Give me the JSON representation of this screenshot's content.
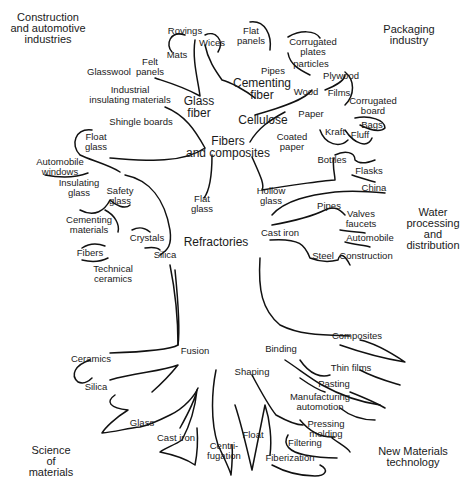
{
  "domains": [
    {
      "id": "construction",
      "label": "Construction\nand automotive\nindustries",
      "x": 48,
      "y": 28
    },
    {
      "id": "packaging",
      "label": "Packaging\nindustry",
      "x": 409,
      "y": 35
    },
    {
      "id": "water",
      "label": "Water\nprocessing\nand\ndistribution",
      "x": 433,
      "y": 229
    },
    {
      "id": "science",
      "label": "Science\nof\nmaterials",
      "x": 51,
      "y": 461
    },
    {
      "id": "new-materials",
      "label": "New Materials\ntechnology",
      "x": 413,
      "y": 457
    }
  ],
  "main_nodes": [
    {
      "id": "fibers-composites",
      "label": "Fibers\nand composites",
      "x": 228,
      "y": 147
    },
    {
      "id": "glass-fiber",
      "label": "Glass\nfiber",
      "x": 199,
      "y": 107
    },
    {
      "id": "cementing-fiber",
      "label": "Cementing\nfiber",
      "x": 262,
      "y": 89
    },
    {
      "id": "cellulose",
      "label": "Cellulose",
      "x": 263,
      "y": 120
    },
    {
      "id": "refractories",
      "label": "Refractories",
      "x": 216,
      "y": 242
    }
  ],
  "nodes": [
    {
      "label": "Rovings",
      "x": 185,
      "y": 31
    },
    {
      "label": "Wices",
      "x": 212,
      "y": 43
    },
    {
      "label": "Mats",
      "x": 177,
      "y": 55
    },
    {
      "label": "Felt\npanels",
      "x": 150,
      "y": 67
    },
    {
      "label": "Glasswool",
      "x": 109,
      "y": 72
    },
    {
      "label": "Industrial\ninsulating materials",
      "x": 130,
      "y": 95
    },
    {
      "label": "Shingle boards",
      "x": 141,
      "y": 122
    },
    {
      "label": "Flat\npanels",
      "x": 251,
      "y": 36
    },
    {
      "label": "Corrugated\nplates",
      "x": 313,
      "y": 47
    },
    {
      "label": "particles",
      "x": 311,
      "y": 64
    },
    {
      "label": "Pipes",
      "x": 273,
      "y": 71
    },
    {
      "label": "Plywood",
      "x": 341,
      "y": 76
    },
    {
      "label": "Wood",
      "x": 306,
      "y": 92
    },
    {
      "label": "Films",
      "x": 339,
      "y": 93
    },
    {
      "label": "Corrugated\nboard",
      "x": 373,
      "y": 106
    },
    {
      "label": "Paper",
      "x": 311,
      "y": 114
    },
    {
      "label": "Bags",
      "x": 372,
      "y": 125
    },
    {
      "label": "Coated\npaper",
      "x": 292,
      "y": 142
    },
    {
      "label": "Kraft",
      "x": 335,
      "y": 132
    },
    {
      "label": "Fluff",
      "x": 360,
      "y": 135
    },
    {
      "label": "Bottles",
      "x": 332,
      "y": 160
    },
    {
      "label": "Flasks",
      "x": 369,
      "y": 171
    },
    {
      "label": "China",
      "x": 374,
      "y": 188
    },
    {
      "label": "Hollow\nglass",
      "x": 271,
      "y": 196
    },
    {
      "label": "Pipes",
      "x": 329,
      "y": 206
    },
    {
      "label": "Valves\nfaucets",
      "x": 361,
      "y": 219
    },
    {
      "label": "Cast iron",
      "x": 280,
      "y": 233
    },
    {
      "label": "Automobile",
      "x": 370,
      "y": 238
    },
    {
      "label": "Steel",
      "x": 323,
      "y": 256
    },
    {
      "label": "Construction",
      "x": 366,
      "y": 256
    },
    {
      "label": "Float\nglass",
      "x": 96,
      "y": 142
    },
    {
      "label": "Automobile\nwindows",
      "x": 60,
      "y": 167
    },
    {
      "label": "Insulating\nglass",
      "x": 79,
      "y": 188
    },
    {
      "label": "Safety\nglass",
      "x": 120,
      "y": 196
    },
    {
      "label": "Flat\nglass",
      "x": 202,
      "y": 204
    },
    {
      "label": "Cementing\nmaterials",
      "x": 89,
      "y": 225
    },
    {
      "label": "Crystals",
      "x": 147,
      "y": 238
    },
    {
      "label": "Fibers",
      "x": 90,
      "y": 253
    },
    {
      "label": "Silica",
      "x": 165,
      "y": 255
    },
    {
      "label": "Technical\nceramics",
      "x": 113,
      "y": 274
    },
    {
      "label": "Composites",
      "x": 357,
      "y": 336
    },
    {
      "label": "Fusion",
      "x": 195,
      "y": 351
    },
    {
      "label": "Binding",
      "x": 281,
      "y": 349
    },
    {
      "label": "Ceramics",
      "x": 91,
      "y": 359
    },
    {
      "label": "Thin films",
      "x": 351,
      "y": 368
    },
    {
      "label": "Shaping",
      "x": 252,
      "y": 372
    },
    {
      "label": "Pasting",
      "x": 334,
      "y": 384
    },
    {
      "label": "Silica",
      "x": 96,
      "y": 387
    },
    {
      "label": "Manufacturing\nautomotion",
      "x": 320,
      "y": 402
    },
    {
      "label": "Pressing\nmolding",
      "x": 326,
      "y": 429
    },
    {
      "label": "Glass",
      "x": 142,
      "y": 423
    },
    {
      "label": "Cast iron",
      "x": 176,
      "y": 438
    },
    {
      "label": "Float",
      "x": 253,
      "y": 435
    },
    {
      "label": "Centri-\nfugation",
      "x": 224,
      "y": 451
    },
    {
      "label": "Filtering",
      "x": 305,
      "y": 443
    },
    {
      "label": "Fiberization",
      "x": 290,
      "y": 458
    }
  ]
}
